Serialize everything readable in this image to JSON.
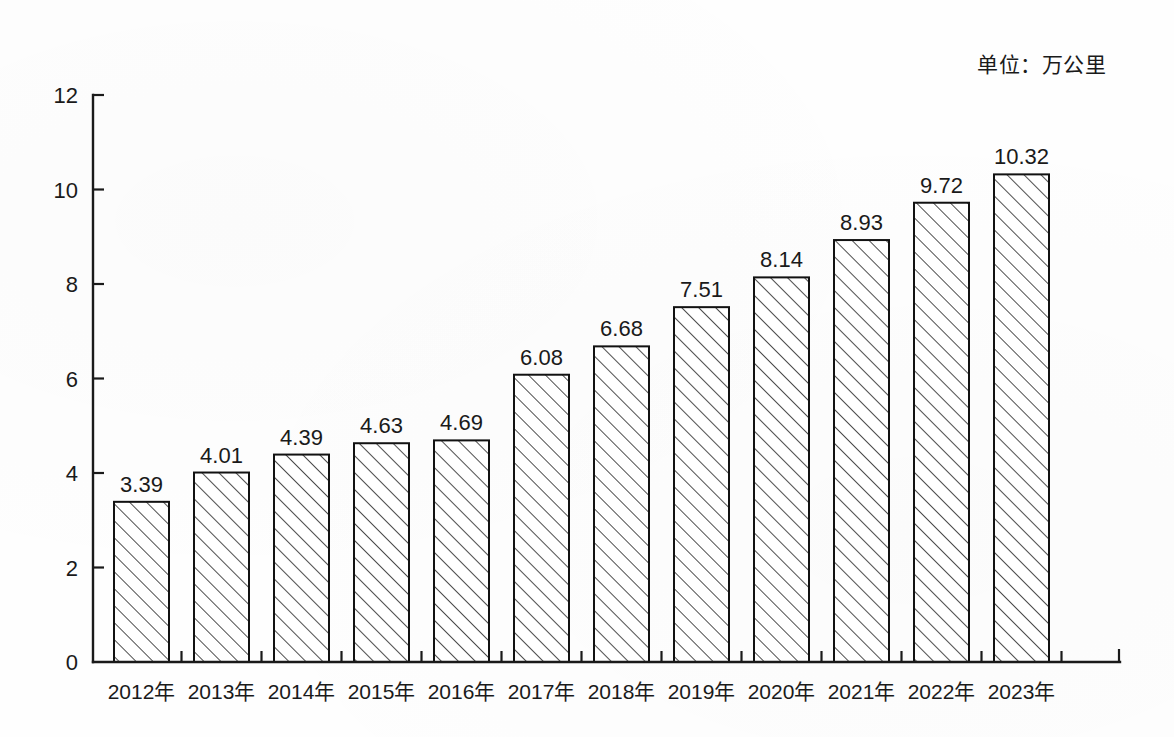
{
  "unit_note": "单位：万公里",
  "chart_data": {
    "type": "bar",
    "title": "",
    "subtitle": "",
    "xlabel": "",
    "ylabel": "",
    "unit": "单位：万公里",
    "categories": [
      "2012年",
      "2013年",
      "2014年",
      "2015年",
      "2016年",
      "2017年",
      "2018年",
      "2019年",
      "2020年",
      "2021年",
      "2022年",
      "2023年"
    ],
    "values": [
      3.39,
      4.01,
      4.39,
      4.63,
      4.69,
      6.08,
      6.68,
      7.51,
      8.14,
      8.93,
      9.72,
      10.32
    ],
    "value_labels": [
      "3.39",
      "4.01",
      "4.39",
      "4.63",
      "4.69",
      "6.08",
      "6.68",
      "7.51",
      "8.14",
      "8.93",
      "9.72",
      "10.32"
    ],
    "ylim": [
      0,
      12
    ],
    "yticks": [
      0,
      2,
      4,
      6,
      8,
      10,
      12
    ],
    "ytick_labels": [
      "0",
      "2",
      "4",
      "6",
      "8",
      "10",
      "12"
    ],
    "grid": false,
    "legend": null,
    "bar_style": {
      "fill": "diagonal-hatch",
      "hatch_angle_deg": 45,
      "border_color": "#121212",
      "face_color": "#ffffff",
      "hatch_color": "#3a3a3a"
    }
  },
  "colors": {
    "background": "#fefefe",
    "axis": "#1a1a1a",
    "text": "#1a1a1a"
  }
}
